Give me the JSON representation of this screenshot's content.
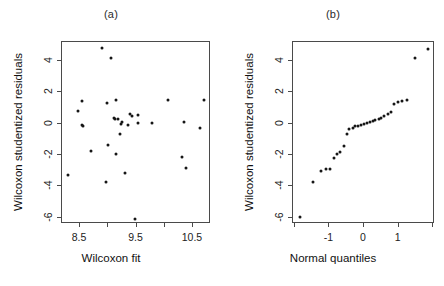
{
  "figure": {
    "background": "#ffffff",
    "point_color": "#161616",
    "axis_color": "#4a4a4a"
  },
  "panels": [
    {
      "label": "(a)",
      "name": "residuals-vs-fit"
    },
    {
      "label": "(b)",
      "name": "normal-qq"
    }
  ],
  "chart_data": [
    {
      "type": "scatter",
      "panel_label": "(a)",
      "title": "",
      "xlabel": "Wilcoxon fit",
      "ylabel": "Wilcoxon studentized residuals",
      "xlim": [
        8.18,
        10.82
      ],
      "ylim": [
        -6.4,
        5.2
      ],
      "xticks": [
        8.5,
        9.5,
        10.5
      ],
      "xticklabels": [
        "8.5",
        "9.5",
        "10.5"
      ],
      "xticks_minor": [
        9.0,
        10.0
      ],
      "yticks": [
        -6,
        -4,
        -2,
        0,
        2,
        4
      ],
      "yticklabels": [
        "-6",
        "-4",
        "-2",
        "0",
        "2",
        "4"
      ],
      "grid": false,
      "legend": false,
      "x": [
        8.29,
        8.47,
        8.53,
        8.53,
        8.56,
        8.7,
        8.88,
        8.96,
        8.98,
        9.0,
        9.04,
        9.1,
        9.12,
        9.13,
        9.14,
        9.17,
        9.2,
        9.22,
        9.25,
        9.3,
        9.35,
        9.38,
        9.42,
        9.48,
        9.52,
        9.53,
        9.78,
        10.05,
        10.3,
        10.34,
        10.38,
        10.62,
        10.7
      ],
      "y": [
        -3.25,
        0.82,
        1.42,
        -0.12,
        -0.18,
        -1.72,
        4.82,
        -3.75,
        1.3,
        -1.38,
        4.18,
        0.38,
        0.3,
        1.48,
        -1.95,
        0.32,
        -0.65,
        -0.02,
        0.08,
        -3.15,
        -0.12,
        0.62,
        0.48,
        -6.05,
        0.05,
        0.52,
        0.02,
        1.5,
        -2.15,
        0.12,
        -2.85,
        -0.3,
        1.48
      ]
    },
    {
      "type": "scatter",
      "panel_label": "(b)",
      "title": "",
      "xlabel": "Normal quantiles",
      "ylabel": "Wilcoxon studentized residuals",
      "xlim": [
        -2.05,
        2.05
      ],
      "ylim": [
        -6.4,
        5.2
      ],
      "xticks": [
        -1,
        0,
        1
      ],
      "xticklabels": [
        "-1",
        "0",
        "1"
      ],
      "xticks_minor": [
        -2,
        2
      ],
      "yticks": [
        -6,
        -4,
        -2,
        0,
        2,
        4
      ],
      "yticklabels": [
        "-6",
        "-4",
        "-2",
        "0",
        "2",
        "4"
      ],
      "grid": false,
      "legend": false,
      "x": [
        -1.85,
        -1.48,
        -1.24,
        -1.1,
        -0.99,
        -0.88,
        -0.78,
        -0.68,
        -0.59,
        -0.5,
        -0.42,
        -0.33,
        -0.25,
        -0.17,
        -0.08,
        0.0,
        0.08,
        0.17,
        0.25,
        0.33,
        0.42,
        0.5,
        0.59,
        0.68,
        0.78,
        0.88,
        0.99,
        1.1,
        1.24,
        1.48,
        1.85
      ],
      "y": [
        -5.95,
        -3.7,
        -3.05,
        -2.92,
        -2.9,
        -2.18,
        -1.92,
        -1.78,
        -1.42,
        -0.68,
        -0.35,
        -0.25,
        -0.18,
        -0.15,
        -0.12,
        -0.05,
        0.02,
        0.08,
        0.15,
        0.22,
        0.32,
        0.38,
        0.48,
        0.58,
        0.75,
        1.28,
        1.4,
        1.45,
        1.5,
        4.18,
        4.78
      ]
    }
  ]
}
